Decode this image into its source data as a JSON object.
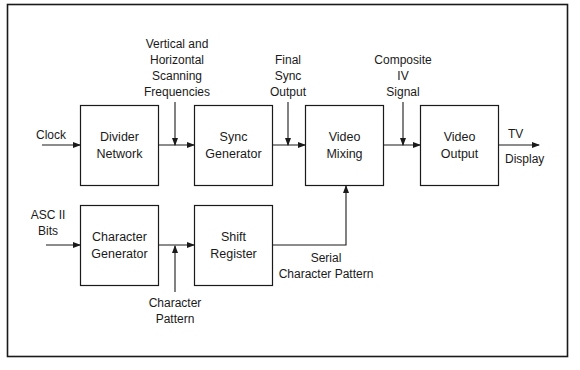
{
  "diagram": {
    "type": "block-diagram",
    "blocks": [
      {
        "id": "divider",
        "lines": [
          "Divider",
          "Network"
        ]
      },
      {
        "id": "sync",
        "lines": [
          "Sync",
          "Generator"
        ]
      },
      {
        "id": "mixing",
        "lines": [
          "Video",
          "Mixing"
        ]
      },
      {
        "id": "output",
        "lines": [
          "Video",
          "Output"
        ]
      },
      {
        "id": "chargen",
        "lines": [
          "Character",
          "Generator"
        ]
      },
      {
        "id": "shift",
        "lines": [
          "Shift",
          "Register"
        ]
      }
    ],
    "labels": {
      "clock": "Clock",
      "ascii": [
        "ASC II",
        "Bits"
      ],
      "scanning": [
        "Vertical and",
        "Horizontal",
        "Scanning",
        "Frequencies"
      ],
      "final_sync": [
        "Final",
        "Sync",
        "Output"
      ],
      "composite": [
        "Composite",
        "IV",
        "Signal"
      ],
      "tv": "TV",
      "display": "Display",
      "char_pattern": [
        "Character",
        "Pattern"
      ],
      "serial": [
        "Serial",
        "Character Pattern"
      ]
    },
    "connections": [
      {
        "from": "Clock",
        "to": "divider"
      },
      {
        "from": "divider",
        "to": "sync"
      },
      {
        "from": "sync",
        "to": "mixing"
      },
      {
        "from": "mixing",
        "to": "output"
      },
      {
        "from": "output",
        "to": "TV Display"
      },
      {
        "from": "ASCII Bits",
        "to": "chargen"
      },
      {
        "from": "chargen",
        "to": "shift"
      },
      {
        "from": "shift",
        "to": "mixing"
      }
    ]
  }
}
